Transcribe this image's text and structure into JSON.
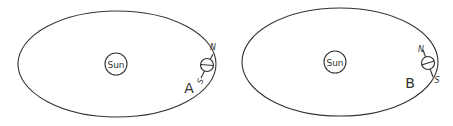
{
  "diagrams": [
    {
      "id": "A",
      "label": "A",
      "sun_label": "Sun",
      "north_label": "N",
      "south_label": "S",
      "axis_tilt": "north pole tilted right (toward away from Sun)"
    },
    {
      "id": "B",
      "label": "B",
      "sun_label": "Sun",
      "north_label": "N",
      "south_label": "S",
      "axis_tilt": "north pole tilted left (toward Sun)"
    }
  ]
}
